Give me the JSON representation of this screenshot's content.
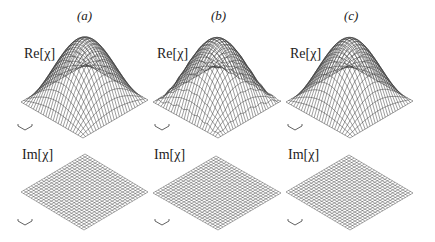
{
  "figure": {
    "panels": [
      {
        "id": "a",
        "label": "(a)",
        "label_pos": [
          77,
          8
        ],
        "re_label": "Re[χ]",
        "re_label_pos": [
          24,
          46
        ],
        "im_label": "Im[χ]",
        "im_label_pos": [
          22,
          147
        ],
        "re_surface": {
          "left": [
            21,
            102
          ],
          "right": [
            148,
            100
          ],
          "bottom": [
            83,
            138
          ],
          "height": 62,
          "noise": 0
        },
        "im_surface": {
          "left": [
            21,
            192
          ],
          "right": [
            148,
            192
          ],
          "bottom": [
            84,
            230
          ],
          "top": [
            84,
            160
          ]
        },
        "re_axes_icon": [
          18,
          127
        ],
        "im_axes_icon": [
          18,
          222
        ]
      },
      {
        "id": "b",
        "label": "(b)",
        "label_pos": [
          211,
          8
        ],
        "re_label": "Re[χ]",
        "re_label_pos": [
          157,
          46
        ],
        "im_label": "Im[χ]",
        "im_label_pos": [
          154,
          147
        ],
        "re_surface": {
          "left": [
            153,
            102
          ],
          "right": [
            281,
            101
          ],
          "bottom": [
            218,
            138
          ],
          "height": 62,
          "noise": 1
        },
        "im_surface": {
          "left": [
            153,
            193
          ],
          "right": [
            281,
            193
          ],
          "bottom": [
            218,
            230
          ],
          "top": [
            218,
            158
          ]
        },
        "re_axes_icon": [
          155,
          127
        ],
        "im_axes_icon": [
          155,
          222
        ]
      },
      {
        "id": "c",
        "label": "(c)",
        "label_pos": [
          344,
          8
        ],
        "re_label": "Re[χ]",
        "re_label_pos": [
          290,
          46
        ],
        "im_label": "Im[χ]",
        "im_label_pos": [
          288,
          147
        ],
        "re_surface": {
          "left": [
            286,
            102
          ],
          "right": [
            413,
            101
          ],
          "bottom": [
            350,
            138
          ],
          "height": 62,
          "noise": 0
        },
        "im_surface": {
          "left": [
            286,
            192
          ],
          "right": [
            413,
            193
          ],
          "bottom": [
            350,
            230
          ],
          "top": [
            352,
            160
          ]
        },
        "re_axes_icon": [
          288,
          127
        ],
        "im_axes_icon": [
          288,
          222
        ]
      }
    ],
    "grid_lines": 25,
    "line_color": "#3a3a3a"
  }
}
